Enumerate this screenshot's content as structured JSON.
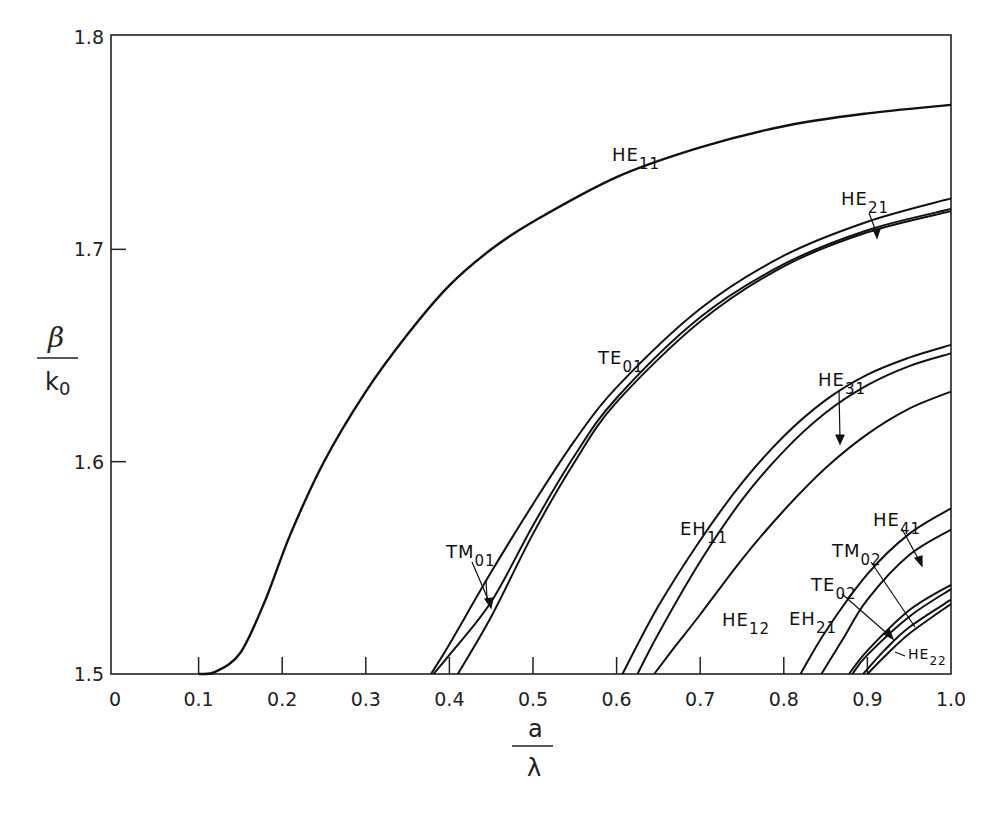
{
  "chart_data": {
    "type": "line",
    "title": "",
    "xlabel": "a / λ",
    "ylabel": "β / k0",
    "xlim": [
      0,
      1.0
    ],
    "ylim": [
      1.5,
      1.8
    ],
    "grid": false,
    "legend": "none (inline curve labels)",
    "x_ticks": [
      "0",
      "0.1",
      "0.2",
      "0.3",
      "0.4",
      "0.5",
      "0.6",
      "0.7",
      "0.8",
      "0.9",
      "1.0"
    ],
    "y_ticks": [
      "1.5",
      "1.6",
      "1.7",
      "1.8"
    ],
    "series": [
      {
        "name": "HE11",
        "x": [
          0.1,
          0.12,
          0.15,
          0.18,
          0.21,
          0.25,
          0.3,
          0.35,
          0.4,
          0.45,
          0.5,
          0.6,
          0.7,
          0.8,
          0.9,
          1.0
        ],
        "values": [
          1.5,
          1.501,
          1.51,
          1.535,
          1.566,
          1.6,
          1.633,
          1.66,
          1.683,
          1.7,
          1.713,
          1.734,
          1.748,
          1.758,
          1.764,
          1.768
        ]
      },
      {
        "name": "TE01",
        "x": [
          0.378,
          0.4,
          0.45,
          0.5,
          0.55,
          0.6,
          0.7,
          0.8,
          0.9,
          1.0
        ],
        "values": [
          1.5,
          1.514,
          1.548,
          1.58,
          1.61,
          1.635,
          1.672,
          1.697,
          1.713,
          1.724
        ]
      },
      {
        "name": "TM01",
        "x": [
          0.381,
          0.4,
          0.45,
          0.5,
          0.55,
          0.6,
          0.7,
          0.8,
          0.9,
          1.0
        ],
        "values": [
          1.5,
          1.509,
          1.534,
          1.57,
          1.603,
          1.63,
          1.668,
          1.693,
          1.709,
          1.719
        ]
      },
      {
        "name": "HE21",
        "x": [
          0.41,
          0.45,
          0.5,
          0.55,
          0.6,
          0.7,
          0.8,
          0.9,
          1.0
        ],
        "values": [
          1.5,
          1.527,
          1.566,
          1.6,
          1.628,
          1.666,
          1.692,
          1.708,
          1.718
        ]
      },
      {
        "name": "EH11",
        "x": [
          0.607,
          0.65,
          0.7,
          0.75,
          0.8,
          0.85,
          0.9,
          0.95,
          1.0
        ],
        "values": [
          1.5,
          1.532,
          1.563,
          1.59,
          1.612,
          1.629,
          1.641,
          1.649,
          1.655
        ]
      },
      {
        "name": "HE31",
        "x": [
          0.625,
          0.65,
          0.7,
          0.75,
          0.8,
          0.85,
          0.9,
          0.95,
          1.0
        ],
        "values": [
          1.5,
          1.519,
          1.553,
          1.582,
          1.605,
          1.623,
          1.636,
          1.645,
          1.651
        ]
      },
      {
        "name": "HE12",
        "x": [
          0.645,
          0.67,
          0.7,
          0.75,
          0.8,
          0.85,
          0.9,
          0.95,
          1.0
        ],
        "values": [
          1.5,
          1.513,
          1.528,
          1.554,
          1.577,
          1.597,
          1.613,
          1.625,
          1.633
        ]
      },
      {
        "name": "EH21",
        "x": [
          0.82,
          0.85,
          0.9,
          0.95,
          1.0
        ],
        "values": [
          1.5,
          1.52,
          1.547,
          1.566,
          1.578
        ]
      },
      {
        "name": "HE41",
        "x": [
          0.845,
          0.87,
          0.9,
          0.95,
          1.0
        ],
        "values": [
          1.5,
          1.516,
          1.535,
          1.556,
          1.568
        ]
      },
      {
        "name": "TM02",
        "x": [
          0.878,
          0.9,
          0.95,
          1.0
        ],
        "values": [
          1.5,
          1.511,
          1.53,
          1.542
        ]
      },
      {
        "name": "TE02",
        "x": [
          0.882,
          0.9,
          0.95,
          1.0
        ],
        "values": [
          1.5,
          1.509,
          1.527,
          1.54
        ]
      },
      {
        "name": "HE22",
        "x": [
          0.895,
          0.92,
          0.95,
          1.0
        ],
        "values": [
          1.5,
          1.511,
          1.522,
          1.535
        ]
      },
      {
        "name": "HE22b",
        "x": [
          0.9,
          0.92,
          0.95,
          1.0
        ],
        "values": [
          1.5,
          1.508,
          1.519,
          1.533
        ]
      }
    ],
    "annotations": [
      "HE11",
      "HE21",
      "TE01",
      "TM01",
      "HE31",
      "EH11",
      "HE12",
      "HE41",
      "TM02",
      "TE02",
      "EH21",
      "HE22"
    ]
  },
  "axes": {
    "x_label_num": "a",
    "x_label_den": "λ",
    "y_label_num": "β",
    "y_label_den": "k",
    "y_label_den_sub": "0"
  },
  "labels": {
    "HE11": {
      "main": "HE",
      "sub": "11"
    },
    "HE21": {
      "main": "HE",
      "sub": "21"
    },
    "TE01": {
      "main": "TE",
      "sub": "01"
    },
    "TM01": {
      "main": "TM",
      "sub": "01"
    },
    "HE31": {
      "main": "HE",
      "sub": "31"
    },
    "EH11": {
      "main": "EH",
      "sub": "11"
    },
    "HE12": {
      "main": "HE",
      "sub": "12"
    },
    "HE41": {
      "main": "HE",
      "sub": "41"
    },
    "TM02": {
      "main": "TM",
      "sub": "02"
    },
    "TE02": {
      "main": "TE",
      "sub": "02"
    },
    "EH21": {
      "main": "EH",
      "sub": "21"
    },
    "HE22": {
      "main": "HE",
      "sub": "22"
    }
  },
  "colors": {
    "line": "#111111",
    "background": "#ffffff",
    "text": "#222222"
  }
}
